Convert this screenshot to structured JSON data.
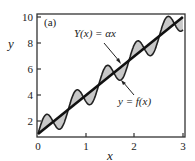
{
  "chart_data": {
    "type": "line",
    "panel_label": "(a)",
    "title": "",
    "xlabel": "x",
    "ylabel": "y",
    "xlim": [
      0,
      3
    ],
    "ylim": [
      1,
      10.2
    ],
    "xticks": [
      "0",
      "1",
      "2",
      "3"
    ],
    "yticks": [
      "2",
      "4",
      "6",
      "8",
      "10"
    ],
    "grid": false,
    "legend": null,
    "series": [
      {
        "name": "Y(x) = αx",
        "style": "thick straight line",
        "x": [
          0,
          3
        ],
        "y": [
          1,
          10
        ]
      },
      {
        "name": "y = f(x)",
        "style": "oscillating curve around the line, area between them shaded grey",
        "description": "linear trend plus sinusoidal oscillation, amplitude ~1, period ~0.63",
        "x": [
          0,
          0.16,
          0.31,
          0.47,
          0.63,
          0.79,
          0.94,
          1.1,
          1.26,
          1.41,
          1.57,
          1.73,
          1.88,
          2.04,
          2.2,
          2.36,
          2.51,
          2.67,
          2.83,
          3.0
        ],
        "y": [
          1.0,
          2.5,
          1.9,
          1.4,
          2.9,
          4.4,
          3.8,
          3.3,
          4.8,
          6.2,
          5.7,
          5.2,
          6.6,
          8.1,
          7.6,
          7.1,
          8.5,
          10.0,
          9.5,
          9.0
        ]
      }
    ],
    "annotations": [
      {
        "text": "Y(x) = αx",
        "arrow_to": [
          1.65,
          6.2
        ]
      },
      {
        "text": "y = f(x)",
        "arrow_to": [
          1.75,
          5.4
        ]
      }
    ]
  },
  "labels": {
    "panel": "(a)",
    "xlabel": "x",
    "ylabel": "y",
    "line_label": "Y(x) = αx",
    "curve_label": "y = f(x)",
    "xticks": [
      "0",
      "1",
      "2",
      "3"
    ],
    "yticks": [
      "2",
      "4",
      "6",
      "8",
      "10"
    ]
  }
}
